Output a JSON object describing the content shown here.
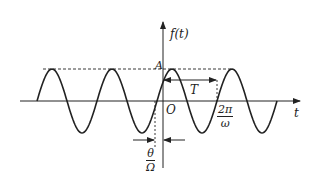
{
  "figure": {
    "colors": {
      "line": "#222222",
      "background": "#ffffff"
    }
  },
  "axes": {
    "y_label": "f(t)",
    "x_label": "t",
    "origin_label": "O"
  },
  "annotations": {
    "amplitude_label": "A",
    "period_label": "T",
    "period_value": {
      "numerator": "2π",
      "denominator": "ω"
    },
    "phase_shift": {
      "numerator": "θ",
      "denominator": "Ω"
    }
  },
  "waveform": {
    "type": "sine",
    "cycles_shown": 4,
    "amplitude_px": 32,
    "period_px": 60
  }
}
